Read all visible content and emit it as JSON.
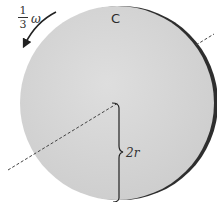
{
  "diagram": {
    "disc_label": "C",
    "angular_velocity": {
      "numerator": "1",
      "denominator": "3",
      "symbol": "ω"
    },
    "dimension_label": "2r",
    "colors": {
      "disc_fill": "#d6d6d6",
      "disc_rim": "#2e2e2e",
      "axis_line": "#444444",
      "text": "#333333"
    }
  }
}
